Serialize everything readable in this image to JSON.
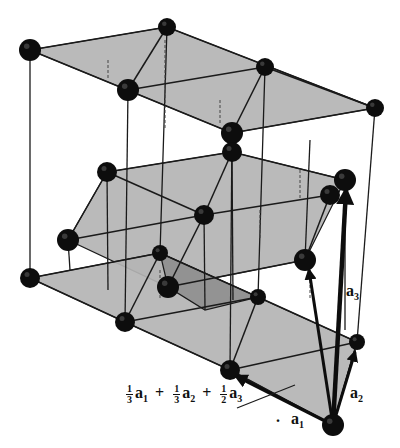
{
  "figure": {
    "colors": {
      "plane_fill": "#b4b4b4",
      "plane_dark_fill": "#8f8f8f",
      "atom": "#0d0d0d",
      "line": "#1a1a1a",
      "background": "#ffffff"
    },
    "planes": [
      {
        "name": "top-plane",
        "points": "30,50 167,27 375,108 232,133"
      },
      {
        "name": "middle-plane",
        "points": "107,172 232,152 345,180 305,260 168,287 68,240"
      },
      {
        "name": "bottom-plane",
        "points": "30,278 160,253 357,342 333,425 230,370 125,322"
      },
      {
        "name": "bottom-dark-patch",
        "points": "160,253 258,297 205,310 168,287"
      }
    ],
    "edges": [
      [
        30,
        50,
        167,
        27
      ],
      [
        167,
        27,
        375,
        108
      ],
      [
        375,
        108,
        232,
        133
      ],
      [
        232,
        133,
        30,
        50
      ],
      [
        128,
        90,
        167,
        27
      ],
      [
        128,
        90,
        265,
        67
      ],
      [
        265,
        67,
        232,
        133
      ],
      [
        265,
        67,
        375,
        108
      ],
      [
        107,
        172,
        232,
        152
      ],
      [
        232,
        152,
        345,
        180
      ],
      [
        68,
        240,
        107,
        172
      ],
      [
        68,
        240,
        204,
        215
      ],
      [
        204,
        215,
        330,
        195
      ],
      [
        204,
        215,
        232,
        152
      ],
      [
        204,
        215,
        168,
        287
      ],
      [
        107,
        172,
        204,
        215
      ],
      [
        168,
        287,
        305,
        260
      ],
      [
        305,
        260,
        330,
        195
      ],
      [
        30,
        278,
        160,
        253
      ],
      [
        30,
        278,
        125,
        322
      ],
      [
        125,
        322,
        160,
        253
      ],
      [
        125,
        322,
        258,
        297
      ],
      [
        258,
        297,
        357,
        342
      ],
      [
        125,
        322,
        230,
        370
      ],
      [
        230,
        370,
        258,
        297
      ],
      [
        230,
        370,
        357,
        342
      ],
      [
        230,
        370,
        333,
        425
      ],
      [
        357,
        342,
        333,
        425
      ],
      [
        160,
        253,
        258,
        297
      ]
    ],
    "verticals": [
      [
        30,
        50,
        30,
        278
      ],
      [
        232,
        133,
        230,
        370
      ],
      [
        375,
        108,
        357,
        342
      ],
      [
        128,
        90,
        125,
        322
      ],
      [
        167,
        27,
        160,
        253
      ],
      [
        265,
        67,
        258,
        297
      ],
      [
        107,
        172,
        108,
        290
      ],
      [
        232,
        152,
        233,
        300
      ],
      [
        204,
        215,
        205,
        310
      ],
      [
        68,
        240,
        70,
        270
      ],
      [
        310,
        140,
        305,
        260
      ],
      [
        345,
        180,
        345,
        330
      ]
    ],
    "dashed_hidden": [
      [
        108,
        60,
        108,
        80
      ],
      [
        165,
        40,
        165,
        130
      ],
      [
        220,
        100,
        220,
        125
      ],
      [
        160,
        270,
        160,
        300
      ],
      [
        260,
        210,
        260,
        240
      ],
      [
        300,
        170,
        300,
        200
      ],
      [
        310,
        280,
        310,
        300
      ]
    ],
    "atoms": [
      {
        "x": 30,
        "y": 50,
        "r": 11
      },
      {
        "x": 167,
        "y": 27,
        "r": 9
      },
      {
        "x": 265,
        "y": 67,
        "r": 9
      },
      {
        "x": 375,
        "y": 108,
        "r": 9
      },
      {
        "x": 128,
        "y": 90,
        "r": 11
      },
      {
        "x": 232,
        "y": 133,
        "r": 11
      },
      {
        "x": 232,
        "y": 152,
        "r": 10
      },
      {
        "x": 107,
        "y": 172,
        "r": 10
      },
      {
        "x": 345,
        "y": 180,
        "r": 11
      },
      {
        "x": 330,
        "y": 195,
        "r": 10
      },
      {
        "x": 204,
        "y": 215,
        "r": 10
      },
      {
        "x": 68,
        "y": 240,
        "r": 11
      },
      {
        "x": 305,
        "y": 260,
        "r": 11
      },
      {
        "x": 168,
        "y": 287,
        "r": 11
      },
      {
        "x": 30,
        "y": 278,
        "r": 10
      },
      {
        "x": 160,
        "y": 253,
        "r": 8
      },
      {
        "x": 258,
        "y": 297,
        "r": 8
      },
      {
        "x": 125,
        "y": 322,
        "r": 10
      },
      {
        "x": 230,
        "y": 370,
        "r": 10
      },
      {
        "x": 357,
        "y": 342,
        "r": 8
      },
      {
        "x": 333,
        "y": 425,
        "r": 11
      }
    ],
    "vectors": [
      {
        "name": "a1",
        "x1": 333,
        "y1": 425,
        "x2": 236,
        "y2": 376,
        "width": 3.5
      },
      {
        "name": "a2",
        "x1": 333,
        "y1": 425,
        "x2": 355,
        "y2": 352,
        "width": 3
      },
      {
        "name": "a3",
        "x1": 333,
        "y1": 425,
        "x2": 346,
        "y2": 190,
        "width": 4.5
      },
      {
        "name": "diag",
        "x1": 333,
        "y1": 425,
        "x2": 309,
        "y2": 270,
        "width": 3
      }
    ],
    "pointer_line": [
      237,
      408,
      295,
      385
    ]
  },
  "labels": {
    "a1": {
      "letter": "a",
      "sub": "1"
    },
    "a2": {
      "letter": "a",
      "sub": "2"
    },
    "a3": {
      "letter": "a",
      "sub": "3"
    },
    "formula": {
      "t1": {
        "num": "1",
        "den": "3",
        "letter": "a",
        "sub": "1"
      },
      "plus1": "+",
      "t2": {
        "num": "1",
        "den": "3",
        "letter": "a",
        "sub": "2"
      },
      "plus2": "+",
      "t3": {
        "num": "1",
        "den": "2",
        "letter": "a",
        "sub": "3"
      }
    },
    "dot": "."
  }
}
